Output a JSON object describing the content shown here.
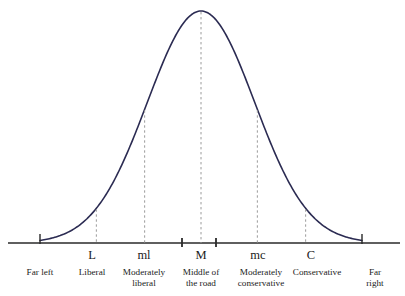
{
  "figure": {
    "title": "",
    "curve_color": "#2b2b52",
    "axis_color": "#2a2a2a",
    "dash_color": "#9a9a9a",
    "background": "#ffffff"
  },
  "chart_data": {
    "type": "line",
    "title": "",
    "xlabel": "",
    "ylabel": "",
    "grid": false,
    "legend": null,
    "xlim": [
      -3,
      3
    ],
    "ylim": [
      0,
      1
    ],
    "curve": "gaussian",
    "mean": 0,
    "sd": 1,
    "x": [
      -3,
      -2.75,
      -2.5,
      -2.25,
      -2,
      -1.75,
      -1.5,
      -1.25,
      -1,
      -0.75,
      -0.5,
      -0.25,
      0,
      0.25,
      0.5,
      0.75,
      1,
      1.25,
      1.5,
      1.75,
      2,
      2.25,
      2.5,
      2.75,
      3
    ],
    "y": [
      0.011,
      0.023,
      0.044,
      0.079,
      0.135,
      0.216,
      0.325,
      0.458,
      0.607,
      0.755,
      0.882,
      0.969,
      1.0,
      0.969,
      0.882,
      0.755,
      0.607,
      0.458,
      0.325,
      0.216,
      0.135,
      0.079,
      0.044,
      0.023,
      0.011
    ],
    "markers": [
      {
        "key": "far_left",
        "symbol": "",
        "x": -3.0,
        "category": "Far left",
        "category_line2": "",
        "tick": "axis",
        "dashed": false
      },
      {
        "key": "liberal",
        "symbol": "L",
        "x": -1.95,
        "category": "Liberal",
        "category_line2": "",
        "tick": "none",
        "dashed": true
      },
      {
        "key": "mod_liberal",
        "symbol": "ml",
        "x": -1.05,
        "category": "Moderately",
        "category_line2": "liberal",
        "tick": "none",
        "dashed": true
      },
      {
        "key": "middle",
        "symbol": "M",
        "x": 0.0,
        "category": "Middle of",
        "category_line2": "the road",
        "tick": "double",
        "dashed": true
      },
      {
        "key": "mod_cons",
        "symbol": "mc",
        "x": 1.05,
        "category": "Moderately",
        "category_line2": "conservative",
        "tick": "none",
        "dashed": true
      },
      {
        "key": "conservative",
        "symbol": "C",
        "x": 1.95,
        "category": "Conservative",
        "category_line2": "",
        "tick": "none",
        "dashed": true
      },
      {
        "key": "far_right",
        "symbol": "",
        "x": 3.0,
        "category": "Far right",
        "category_line2": "",
        "tick": "axis",
        "dashed": false
      }
    ]
  }
}
